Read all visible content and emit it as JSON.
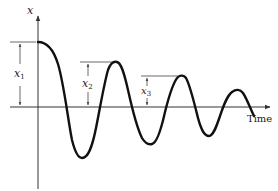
{
  "diagram": {
    "type": "damped-oscillation",
    "y_axis_label": "x",
    "x_axis_label": "Time",
    "amplitude_labels": [
      {
        "name": "x",
        "subscript": "1"
      },
      {
        "name": "x",
        "subscript": "2"
      },
      {
        "name": "x",
        "subscript": "3"
      }
    ],
    "colors": {
      "curve": "#111111",
      "axes": "#333333",
      "annotations": "#444444",
      "background": "#ffffff"
    }
  }
}
